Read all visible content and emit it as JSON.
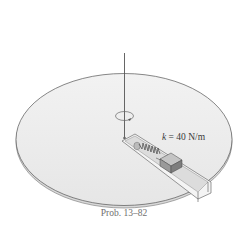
{
  "figure": {
    "spring_label_var": "k",
    "spring_label_rest": " = 40 N/m",
    "caption": "Prob. 13–82"
  },
  "colors": {
    "disk_fill": "#eeeeee",
    "disk_edge": "#555555",
    "block_fill": "#9a9a9a",
    "slot_fill": "#f4f4f4"
  }
}
